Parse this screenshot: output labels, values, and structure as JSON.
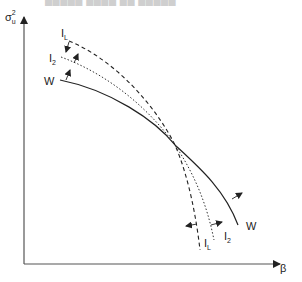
{
  "caption": "█████ ████ ██ █████",
  "axes": {
    "y_label": "σ",
    "y_label_sub": "u",
    "y_label_sup": "2",
    "x_label": "β"
  },
  "curves": {
    "W": {
      "label": "W",
      "label_end": "W",
      "style": "solid"
    },
    "I2": {
      "label": "I",
      "label_sub": "2",
      "label_end": "I",
      "label_end_sub": "2",
      "style": "dotted"
    },
    "IL": {
      "label": "I",
      "label_sub": "L",
      "label_end": "I",
      "label_end_sub": "L",
      "style": "dashed"
    }
  },
  "colors": {
    "line": "#222222",
    "background": "#ffffff"
  }
}
